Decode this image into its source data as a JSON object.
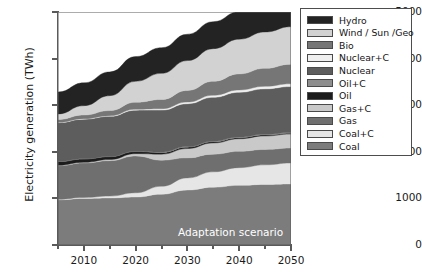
{
  "chart_data": {
    "type": "area",
    "title": "",
    "xlabel": "",
    "ylabel": "Electricity generation (TWh)",
    "annotation": "Adaptation scenario",
    "xlim": [
      2005,
      2050
    ],
    "ylim": [
      0,
      5000
    ],
    "grid": false,
    "legend_position": "right-outside",
    "x": [
      2005,
      2010,
      2015,
      2020,
      2025,
      2030,
      2035,
      2040,
      2045,
      2050
    ],
    "x_ticks": [
      2010,
      2020,
      2030,
      2040,
      2050
    ],
    "x_minor_ticks": [
      2005,
      2015,
      2025,
      2035,
      2045
    ],
    "y_ticks": [
      0,
      1000,
      2000,
      3000,
      4000,
      5000
    ],
    "stack_order_bottom_to_top": [
      "Coal",
      "Coal+C",
      "Gas",
      "Gas+C",
      "Oil",
      "Oil+C",
      "Nuclear",
      "Nuclear+C",
      "Bio",
      "Wind / Sun /Geo",
      "Hydro"
    ],
    "series": [
      {
        "name": "Coal",
        "color": "#7c7c7c",
        "values": [
          970,
          1000,
          1010,
          1030,
          1090,
          1180,
          1240,
          1280,
          1300,
          1310
        ]
      },
      {
        "name": "Coal+C",
        "color": "#e6e6e6",
        "values": [
          10,
          20,
          40,
          90,
          170,
          260,
          330,
          380,
          420,
          450
        ]
      },
      {
        "name": "Gas",
        "color": "#6f6f6f",
        "values": [
          720,
          740,
          760,
          790,
          560,
          430,
          380,
          350,
          330,
          320
        ]
      },
      {
        "name": "Gas+C",
        "color": "#c9c9c9",
        "values": [
          10,
          15,
          25,
          50,
          130,
          200,
          240,
          270,
          290,
          300
        ]
      },
      {
        "name": "Oil",
        "color": "#1c1c1c",
        "values": [
          80,
          70,
          60,
          45,
          35,
          30,
          25,
          22,
          20,
          18
        ]
      },
      {
        "name": "Oil+C",
        "color": "#8e8e8e",
        "values": [
          5,
          5,
          6,
          8,
          10,
          12,
          14,
          15,
          16,
          17
        ]
      },
      {
        "name": "Nuclear",
        "color": "#5d5d5d",
        "values": [
          830,
          850,
          860,
          880,
          900,
          920,
          940,
          960,
          975,
          985
        ]
      },
      {
        "name": "Nuclear+C",
        "color": "#efefef",
        "values": [
          8,
          10,
          14,
          20,
          28,
          36,
          44,
          50,
          55,
          60
        ]
      },
      {
        "name": "Bio",
        "color": "#767676",
        "values": [
          60,
          80,
          110,
          150,
          200,
          250,
          300,
          345,
          385,
          420
        ]
      },
      {
        "name": "Wind / Sun /Geo",
        "color": "#d2d2d2",
        "values": [
          120,
          200,
          320,
          450,
          560,
          640,
          700,
          745,
          780,
          805
        ]
      },
      {
        "name": "Hydro",
        "color": "#232323",
        "values": [
          470,
          490,
          510,
          530,
          550,
          565,
          580,
          590,
          600,
          610
        ]
      }
    ]
  },
  "legend": {
    "items": [
      {
        "label": "Hydro",
        "color": "#232323"
      },
      {
        "label": "Wind / Sun /Geo",
        "color": "#d2d2d2"
      },
      {
        "label": "Bio",
        "color": "#767676"
      },
      {
        "label": "Nuclear+C",
        "color": "#efefef"
      },
      {
        "label": "Nuclear",
        "color": "#5d5d5d"
      },
      {
        "label": "Oil+C",
        "color": "#8e8e8e"
      },
      {
        "label": "Oil",
        "color": "#1c1c1c"
      },
      {
        "label": "Gas+C",
        "color": "#c9c9c9"
      },
      {
        "label": "Gas",
        "color": "#6f6f6f"
      },
      {
        "label": "Coal+C",
        "color": "#e6e6e6"
      },
      {
        "label": "Coal",
        "color": "#7c7c7c"
      }
    ]
  }
}
